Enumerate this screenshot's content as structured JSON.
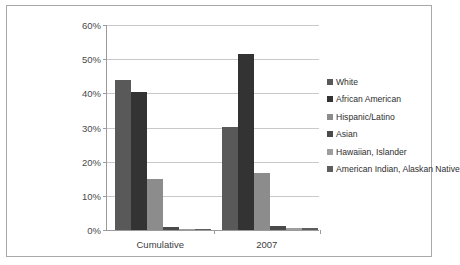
{
  "chart_data": {
    "type": "bar",
    "title": "",
    "xlabel": "",
    "ylabel": "",
    "categories": [
      "Cumulative",
      "2007"
    ],
    "ylim": [
      0,
      60
    ],
    "ytick_labels": [
      "0%",
      "10%",
      "20%",
      "30%",
      "40%",
      "50%",
      "60%"
    ],
    "ytick_values": [
      0,
      10,
      20,
      30,
      40,
      50,
      60
    ],
    "grid": true,
    "legend_position": "right",
    "series": [
      {
        "name": "White",
        "color": "#595959",
        "values": [
          43.8,
          30.2
        ]
      },
      {
        "name": "African American",
        "color": "#333333",
        "values": [
          40.3,
          51.5
        ]
      },
      {
        "name": "Hispanic/Latino",
        "color": "#8c8c8c",
        "values": [
          14.8,
          16.6
        ]
      },
      {
        "name": "Asian",
        "color": "#4a4a4a",
        "values": [
          0.8,
          1.2
        ]
      },
      {
        "name": "Hawaiian,  Islander",
        "color": "#9e9e9e",
        "values": [
          0.2,
          0.6
        ]
      },
      {
        "name": "American Indian, Alaskan Native",
        "color": "#5e5e5e",
        "values": [
          0.2,
          0.6
        ]
      }
    ]
  },
  "legend": {
    "items": [
      {
        "label": "White"
      },
      {
        "label": "African American"
      },
      {
        "label": "Hispanic/Latino"
      },
      {
        "label": "Asian"
      },
      {
        "label": "Hawaiian,  Islander"
      },
      {
        "label": "American Indian, Alaskan Native"
      }
    ]
  },
  "axis": {
    "y_ticks": [
      {
        "label": "60%"
      },
      {
        "label": "50%"
      },
      {
        "label": "40%"
      },
      {
        "label": "30%"
      },
      {
        "label": "20%"
      },
      {
        "label": "10%"
      },
      {
        "label": "0%"
      }
    ]
  },
  "colors": {
    "frame_border": "#a8a8a8",
    "gridline": "#c9c9c9",
    "axis_line": "#9b9b9b",
    "background": "#ffffff",
    "text": "#3d3d3d"
  }
}
